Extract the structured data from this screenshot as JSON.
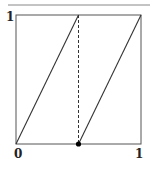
{
  "diagram": {
    "type": "piecewise-linear-map",
    "labels": {
      "y_top": "1",
      "x_origin": "0",
      "x_right": "1"
    },
    "colors": {
      "line": "#333333",
      "frame": "#555555",
      "rule": "#888888",
      "dot": "#000000"
    },
    "segments": [
      {
        "from": [
          0,
          0
        ],
        "to": [
          0.5,
          1
        ]
      },
      {
        "from": [
          0.5,
          0
        ],
        "to": [
          1,
          1
        ]
      }
    ],
    "discontinuity_x": 0.5,
    "marked_point": [
      0.5,
      0
    ]
  }
}
